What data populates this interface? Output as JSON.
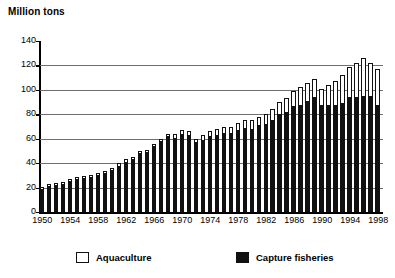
{
  "chart_data": {
    "type": "bar",
    "title": "Million tons",
    "subtitle": "",
    "xlabel": "",
    "ylabel": "Million tons",
    "stacked": true,
    "grid": true,
    "legend_position": "bottom",
    "ylim": [
      0,
      140
    ],
    "yticks": [
      0,
      20,
      40,
      60,
      80,
      100,
      120,
      140
    ],
    "xtick_labels": [
      "1950",
      "1954",
      "1958",
      "1962",
      "1966",
      "1970",
      "1974",
      "1978",
      "1982",
      "1986",
      "1990",
      "1994",
      "1998"
    ],
    "categories": [
      "1950",
      "1951",
      "1952",
      "1953",
      "1954",
      "1955",
      "1956",
      "1957",
      "1958",
      "1959",
      "1960",
      "1961",
      "1962",
      "1963",
      "1964",
      "1965",
      "1966",
      "1967",
      "1968",
      "1969",
      "1970",
      "1971",
      "1972",
      "1973",
      "1974",
      "1975",
      "1976",
      "1977",
      "1978",
      "1979",
      "1980",
      "1981",
      "1982",
      "1983",
      "1984",
      "1985",
      "1986",
      "1987",
      "1988",
      "1989",
      "1990",
      "1991",
      "1992",
      "1993",
      "1994",
      "1995",
      "1996",
      "1997",
      "1998"
    ],
    "series": [
      {
        "name": "Capture fisheries",
        "color": "#111111",
        "values": [
          19,
          21,
          22,
          23,
          25,
          27,
          28,
          29,
          30,
          32,
          34,
          38,
          41,
          43,
          48,
          49,
          54,
          58,
          62,
          61,
          64,
          63,
          57,
          59,
          62,
          63,
          65,
          65,
          67,
          69,
          68,
          71,
          72,
          75,
          80,
          82,
          87,
          88,
          91,
          94,
          88,
          88,
          88,
          89,
          94,
          94,
          95,
          95,
          88
        ]
      },
      {
        "name": "Aquaculture",
        "color": "#ffffff",
        "values": [
          1,
          1,
          1,
          1,
          1,
          1,
          1,
          1,
          1,
          1,
          2,
          2,
          2,
          2,
          2,
          2,
          2,
          2,
          2,
          3,
          3,
          3,
          3,
          4,
          4,
          5,
          5,
          5,
          6,
          6,
          7,
          7,
          8,
          9,
          10,
          11,
          12,
          14,
          15,
          15,
          13,
          16,
          19,
          23,
          25,
          28,
          31,
          27,
          29
        ]
      }
    ],
    "totals": [
      20,
      22,
      23,
      24,
      26,
      28,
      29,
      30,
      31,
      33,
      36,
      40,
      43,
      45,
      50,
      51,
      56,
      60,
      64,
      64,
      67,
      66,
      60,
      63,
      66,
      68,
      70,
      70,
      73,
      75,
      75,
      78,
      80,
      84,
      90,
      93,
      99,
      102,
      106,
      109,
      101,
      104,
      107,
      112,
      119,
      122,
      126,
      122,
      117
    ]
  },
  "legend": {
    "aquaculture_label": "Aquaculture",
    "capture_label": "Capture fisheries"
  }
}
